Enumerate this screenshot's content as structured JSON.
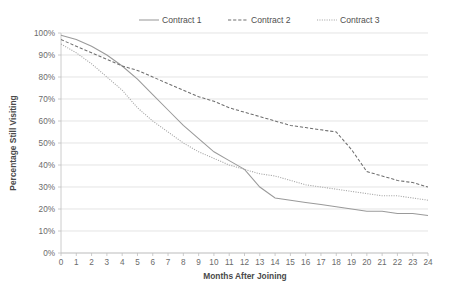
{
  "chart_data": {
    "type": "line",
    "title": "",
    "xlabel": "Months After Joining",
    "ylabel": "Percentage Still Visiting",
    "xlim": [
      0,
      24
    ],
    "ylim": [
      0,
      100
    ],
    "grid": true,
    "legend_position": "top",
    "x": [
      0,
      1,
      2,
      3,
      4,
      5,
      6,
      7,
      8,
      9,
      10,
      11,
      12,
      13,
      14,
      15,
      16,
      17,
      18,
      19,
      20,
      21,
      22,
      23,
      24
    ],
    "x_tick_labels": [
      "0",
      "1",
      "2",
      "3",
      "4",
      "5",
      "6",
      "7",
      "8",
      "9",
      "10",
      "11",
      "12",
      "13",
      "14",
      "15",
      "16",
      "17",
      "18",
      "19",
      "20",
      "21",
      "22",
      "23",
      "24"
    ],
    "y_tick_values": [
      0,
      10,
      20,
      30,
      40,
      50,
      60,
      70,
      80,
      90,
      100
    ],
    "y_tick_labels": [
      "0%",
      "10%",
      "20%",
      "30%",
      "40%",
      "50%",
      "60%",
      "70%",
      "80%",
      "90%",
      "100%"
    ],
    "series": [
      {
        "name": "Contract 1",
        "style": "solid",
        "color": "#9a9a9a",
        "values": [
          99,
          97,
          94,
          90,
          85,
          79,
          72,
          65,
          58,
          52,
          46,
          42,
          38,
          30,
          25,
          24,
          23,
          22,
          21,
          20,
          19,
          19,
          18,
          18,
          17
        ]
      },
      {
        "name": "Contract 2",
        "style": "dashed",
        "color": "#6f6f6f",
        "values": [
          97,
          94,
          91,
          88,
          85,
          83,
          80,
          77,
          74,
          71,
          69,
          66,
          64,
          62,
          60,
          58,
          57,
          56,
          55,
          47,
          37,
          35,
          33,
          32,
          30
        ]
      },
      {
        "name": "Contract 3",
        "style": "dotted",
        "color": "#a6a6a6",
        "values": [
          95,
          91,
          86,
          80,
          74,
          66,
          60,
          55,
          50,
          46,
          43,
          40,
          38,
          36,
          35,
          33,
          31,
          30,
          29,
          28,
          27,
          26,
          26,
          25,
          24
        ]
      }
    ]
  },
  "legend": {
    "items": [
      {
        "label": "Contract 1"
      },
      {
        "label": "Contract 2"
      },
      {
        "label": "Contract 3"
      }
    ]
  }
}
